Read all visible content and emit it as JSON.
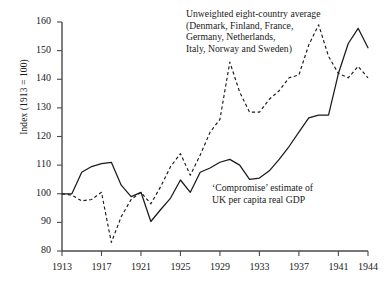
{
  "chart_data": {
    "type": "line",
    "title": "",
    "xlabel": "",
    "ylabel": "Index (1913 = 100)",
    "xlim": [
      1913,
      1944
    ],
    "ylim": [
      80,
      160
    ],
    "grid": false,
    "legend_position": "inline-annotation",
    "x_ticks": [
      "1913",
      "1917",
      "1921",
      "1925",
      "1929",
      "1933",
      "1937",
      "1941",
      "1944"
    ],
    "y_ticks": [
      "80",
      "90",
      "100",
      "110",
      "120",
      "130",
      "140",
      "150",
      "160"
    ],
    "series": [
      {
        "name": "'Compromise' estimate of UK per capita real GDP",
        "style": "solid",
        "color": "#1a1a1a",
        "x": [
          1913,
          1914,
          1915,
          1916,
          1917,
          1918,
          1919,
          1920,
          1921,
          1922,
          1923,
          1924,
          1925,
          1926,
          1927,
          1928,
          1929,
          1930,
          1931,
          1932,
          1933,
          1934,
          1935,
          1936,
          1937,
          1938,
          1939,
          1940,
          1941,
          1942,
          1943,
          1944
        ],
        "values": [
          100,
          100,
          107.5,
          109.5,
          110.5,
          111,
          103,
          99,
          100.5,
          90.3,
          94.5,
          98.5,
          104.8,
          100.5,
          107.5,
          109,
          111,
          112,
          110,
          105,
          105.5,
          108,
          112,
          116.5,
          121.5,
          126.5,
          127.5,
          127.5,
          142,
          152.5,
          157.8,
          151
        ]
      },
      {
        "name": "Unweighted eight-country average (Denmark, Finland, France, Germany, Netherlands, Italy, Norway and Sweden)",
        "style": "dashed",
        "color": "#1a1a1a",
        "x": [
          1913,
          1914,
          1915,
          1916,
          1917,
          1918,
          1919,
          1920,
          1921,
          1922,
          1923,
          1924,
          1925,
          1926,
          1927,
          1928,
          1929,
          1930,
          1931,
          1932,
          1933,
          1934,
          1935,
          1936,
          1937,
          1938,
          1939,
          1940,
          1941,
          1942,
          1943,
          1944
        ],
        "values": [
          100,
          99.5,
          97.5,
          98,
          100.5,
          83,
          92,
          98,
          100.5,
          96.5,
          102.5,
          109.5,
          114,
          106.5,
          113.5,
          121.5,
          126,
          146,
          135.5,
          128.5,
          128.5,
          133,
          136,
          140.5,
          141.5,
          152,
          159,
          148,
          142,
          140.5,
          144.5,
          140.5
        ]
      }
    ],
    "annotations": [
      {
        "id": "eight-country-label",
        "lines": [
          "Unweighted eight-country average",
          "(Denmark, Finland, France,",
          "Germany, Netherlands,",
          "Italy, Norway and Sweden)"
        ]
      },
      {
        "id": "uk-compromise-label",
        "lines": [
          "'Compromise' estimate of",
          "UK per capita real GDP"
        ]
      }
    ]
  },
  "axes": {
    "y_label": "Index (1913 = 100)",
    "y_ticks": [
      {
        "value": "160"
      },
      {
        "value": "150"
      },
      {
        "value": "140"
      },
      {
        "value": "130"
      },
      {
        "value": "120"
      },
      {
        "value": "110"
      },
      {
        "value": "100"
      },
      {
        "value": "90"
      },
      {
        "value": "80"
      }
    ],
    "x_ticks": [
      {
        "value": "1913"
      },
      {
        "value": "1917"
      },
      {
        "value": "1921"
      },
      {
        "value": "1925"
      },
      {
        "value": "1929"
      },
      {
        "value": "1933"
      },
      {
        "value": "1937"
      },
      {
        "value": "1941"
      },
      {
        "value": "1944"
      }
    ]
  },
  "legend": {
    "eight_country": {
      "line1": "Unweighted eight-country average",
      "line2": "(Denmark, Finland, France,",
      "line3": "Germany, Netherlands,",
      "line4": "Italy, Norway and Sweden)"
    },
    "uk_compromise": {
      "line1": "‘Compromise’ estimate of",
      "line2": "UK per capita real GDP"
    }
  }
}
